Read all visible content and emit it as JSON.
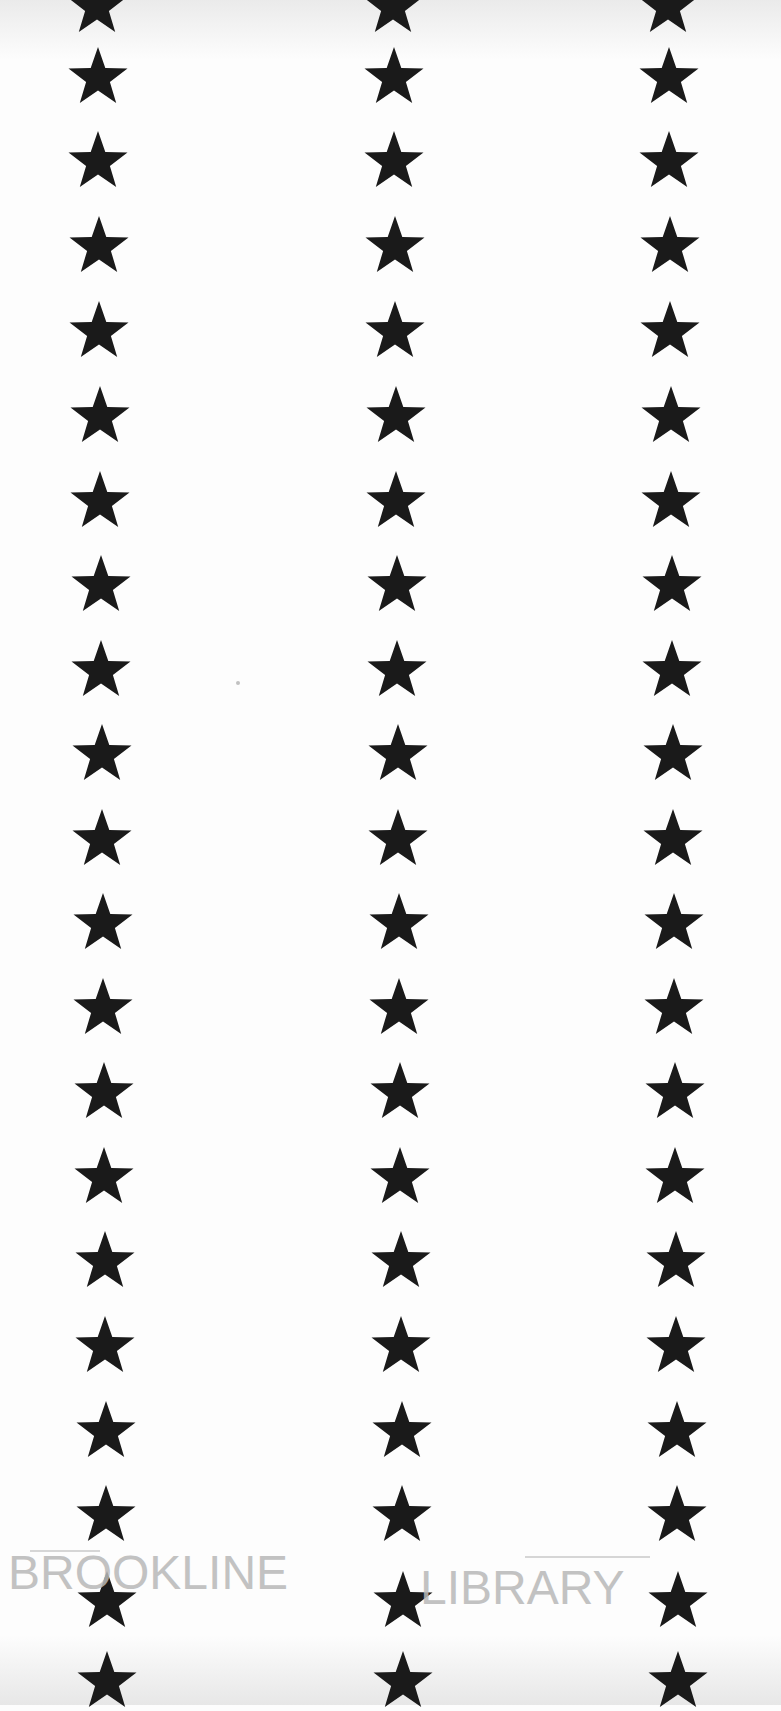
{
  "document": {
    "type": "scanned page",
    "content": "three vertical columns of five-pointed black stars",
    "star_color": "#1a1a1a",
    "background_color": "#fdfdfd",
    "columns": [
      {
        "name": "left",
        "x_top": 97,
        "x_bottom": 107
      },
      {
        "name": "middle",
        "x_top": 393,
        "x_bottom": 403
      },
      {
        "name": "right",
        "x_top": 668,
        "x_bottom": 678
      }
    ],
    "row_y_centers": [
      5,
      76,
      160,
      245,
      330,
      415,
      500,
      584,
      669,
      753,
      838,
      922,
      1007,
      1091,
      1176,
      1260,
      1345,
      1430,
      1514,
      1600,
      1680
    ],
    "stamp": {
      "left_text": "BROOKLINE",
      "right_text": "LIBRARY",
      "color": "#b8b8b8"
    }
  }
}
